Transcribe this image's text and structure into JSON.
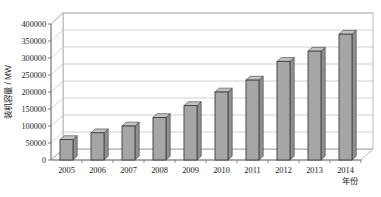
{
  "chart_data": {
    "type": "bar",
    "title": "",
    "xlabel": "年份",
    "ylabel": "装机容量 / MW",
    "categories": [
      "2005",
      "2006",
      "2007",
      "2008",
      "2009",
      "2010",
      "2011",
      "2012",
      "2013",
      "2014"
    ],
    "values": [
      60000,
      80000,
      100000,
      125000,
      160000,
      200000,
      235000,
      290000,
      320000,
      370000
    ],
    "ylim": [
      0,
      400000
    ],
    "ytick_labels": [
      "0",
      "50000",
      "100000",
      "150000",
      "200000",
      "250000",
      "300000",
      "350000",
      "400000"
    ],
    "ytick_values": [
      0,
      50000,
      100000,
      150000,
      200000,
      250000,
      300000,
      350000,
      400000
    ],
    "grid": true,
    "legend": "none",
    "series": [
      {
        "name": "装机容量",
        "values": [
          60000,
          80000,
          100000,
          125000,
          160000,
          200000,
          235000,
          290000,
          320000,
          370000
        ]
      }
    ],
    "style": {
      "bar_fill": "#a6a6a6",
      "bar_stroke": "#3d3d3d",
      "grid_color": "#b9b9b9",
      "axis_color": "#6f6f6f",
      "plot_background": "#ffffff",
      "three_d": true
    }
  }
}
